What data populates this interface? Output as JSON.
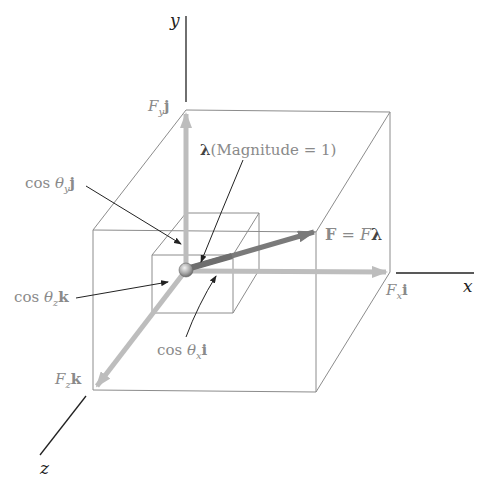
{
  "axes": {
    "x": "x",
    "y": "y",
    "z": "z"
  },
  "labels": {
    "fy": {
      "base": "F",
      "sub": "y",
      "vec": "j"
    },
    "fx": {
      "base": "F",
      "sub": "x",
      "vec": "i"
    },
    "fz": {
      "base": "F",
      "sub": "z",
      "vec": "k"
    },
    "lambda": {
      "sym": "λ",
      "text": "(Magnitude = 1)"
    },
    "cos_y": {
      "pre": "cos ",
      "theta": "θ",
      "sub": "y",
      "vec": "j"
    },
    "cos_z": {
      "pre": "cos ",
      "theta": "θ",
      "sub": "z",
      "vec": "k"
    },
    "cos_x": {
      "pre": "cos ",
      "theta": "θ",
      "sub": "x",
      "vec": "i"
    },
    "force": {
      "lhs": "F",
      "eq": " = ",
      "rhs_italic": "F",
      "rhs_sym": "λ"
    }
  },
  "colors": {
    "axis": "#222222",
    "box": "#8c8c8c",
    "component_arrow": "#bdbdbd",
    "force_arrow": "#7a7a7a",
    "leader": "#222222",
    "label": "#8a8a8a"
  }
}
